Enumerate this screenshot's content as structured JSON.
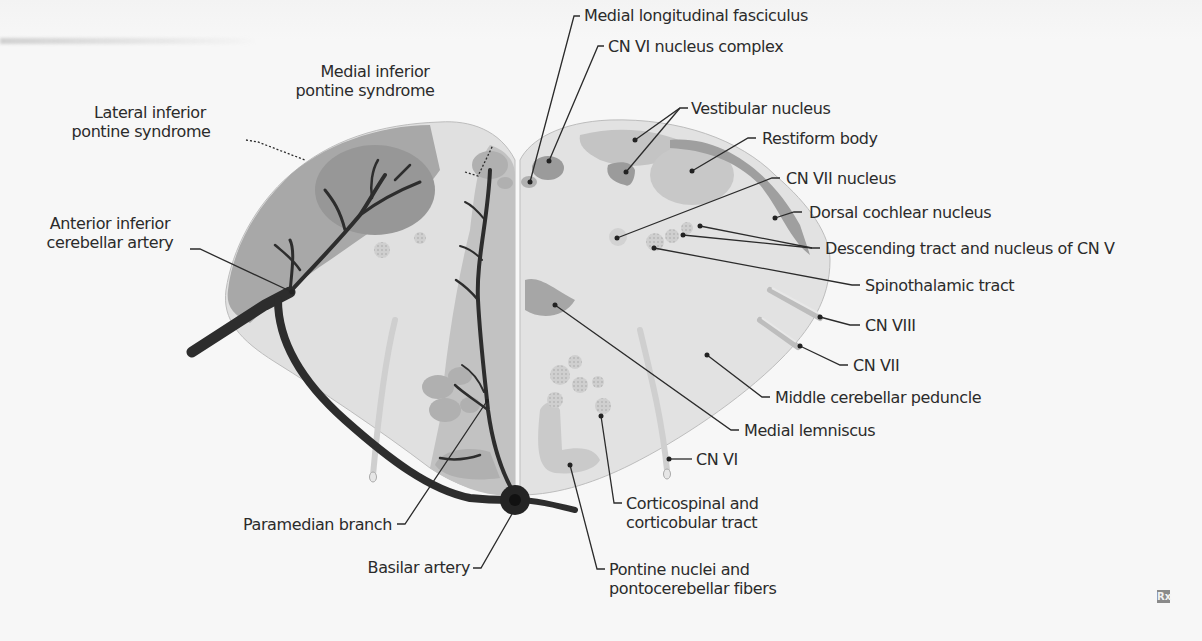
{
  "figure": {
    "colors": {
      "background": "#f7f7f7",
      "tissue_light": "#dedede",
      "tissue_mid": "#c4c4c4",
      "tissue_dark": "#a9a9a9",
      "artery": "#2d2d2d",
      "label_text": "#2b2b2b"
    }
  },
  "labels": {
    "lateral_syndrome": [
      "Lateral inferior",
      "pontine syndrome"
    ],
    "medial_syndrome": [
      "Medial inferior",
      "pontine syndrome"
    ],
    "aica": [
      "Anterior inferior",
      "cerebellar artery"
    ],
    "paramedian_branch": "Paramedian branch",
    "basilar_artery": "Basilar artery",
    "mlf": "Medial longitudinal fasciculus",
    "cn6_nucleus": "CN VI nucleus complex",
    "vestibular_nucleus": "Vestibular  nucleus",
    "restiform_body": "Restiform body",
    "cn7_nucleus": "CN VII nucleus",
    "dorsal_cochlear": "Dorsal cochlear nucleus",
    "descending_cn5": "Descending tract and nucleus of CN V",
    "spinothalamic": "Spinothalamic tract",
    "cn8": "CN VIII",
    "cn7": "CN VII",
    "middle_cerebellar_peduncle": "Middle cerebellar peduncle",
    "medial_lemniscus": "Medial lemniscus",
    "cn6": "CN VI",
    "corticospinal": [
      "Corticospinal and",
      "corticobular tract"
    ],
    "pontine_nuclei": [
      "Pontine nuclei and",
      "pontocerebellar fibers"
    ]
  },
  "watermark": "Rx"
}
